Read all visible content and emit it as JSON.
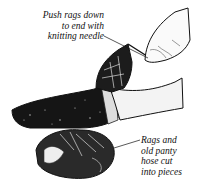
{
  "figure": {
    "type": "illustration",
    "labels": [
      {
        "id": "push-rags-label",
        "lines": [
          "Push rags down",
          "to end with",
          "knitting needle"
        ]
      },
      {
        "id": "rags-label",
        "lines": [
          "Rags and",
          "old panty",
          "hose cut",
          "into pieces"
        ]
      }
    ],
    "colors": {
      "ink": "#111111",
      "paper": "#ffffff"
    }
  }
}
